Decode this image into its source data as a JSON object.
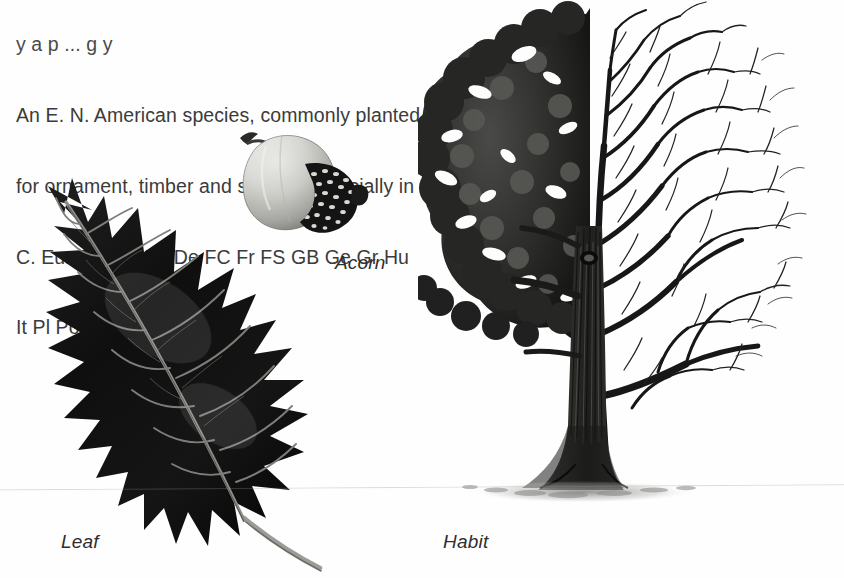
{
  "page": {
    "background_color": "#fefefe",
    "text_color": "#3b3b3b",
    "width": 844,
    "height": 578
  },
  "description": {
    "clipped_top_line": "y a p ... g y",
    "lines": [
      "An E. N. American species, commonly planted",
      "for ornament, timber and shelter, especially in",
      "C. Europe. Au Be De FC Fr FS GB Ge Gr Hu",
      "It Pl Po Ro Sp Sw Sz."
    ]
  },
  "distribution_codes": [
    "Au",
    "Be",
    "De",
    "FC",
    "Fr",
    "FS",
    "GB",
    "Ge",
    "Gr",
    "Hu",
    "It",
    "Pl",
    "Po",
    "Ro",
    "Sp",
    "Sw",
    "Sz"
  ],
  "figures": [
    {
      "id": "acorn",
      "caption": "Acorn",
      "description": "Single acorn, pale gray ovoid nut with short stalk at upper left and dark scaly cup at lower right",
      "colors": {
        "nut": "#c9c9c7",
        "nut_shadow": "#8e8e8c",
        "cup": "#1c1c1c",
        "scales": "#d8d8d4"
      }
    },
    {
      "id": "leaf",
      "caption": "Leaf",
      "description": "Large dark red-oak leaf, deeply lobed with bristle-tipped points, pale midrib and veins, pale petiole to lower right",
      "colors": {
        "blade": "#111111",
        "veins": "#8a8a86",
        "petiole": "#9a9a96"
      }
    },
    {
      "id": "habit",
      "caption": "Habit",
      "description": "Mature oak tree in habit view, left half in full summer foliage, right half bare winter branching, textured trunk with flaring base and ground shadow",
      "colors": {
        "foliage": "#2a2a2a",
        "branches": "#1a1a1a",
        "trunk": "#3a3a38",
        "shadow": "#9a9a98"
      }
    }
  ],
  "captions": {
    "acorn": "Acorn",
    "leaf": "Leaf",
    "habit": "Habit"
  }
}
